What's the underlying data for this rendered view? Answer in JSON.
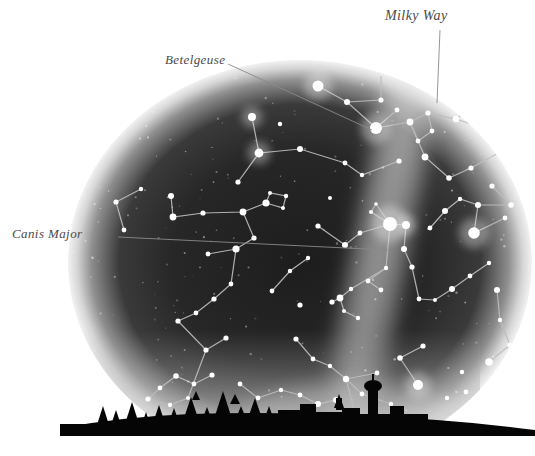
{
  "figure": {
    "background_color": "#ffffff",
    "sky_dark_color": "#262626",
    "sky_edge_glow_color": "#d8d8d8",
    "milkyway_color": "#c9c9c9",
    "star_color": "#ffffff",
    "constellation_line_color": "#bdbdbd",
    "horizon_color": "#050505",
    "label_color": "#4a4a4a",
    "leader_line_color": "#8a8a8a"
  },
  "labels": {
    "milky_way": "Milky Way",
    "betelgeuse": "Betelgeuse",
    "canis_major": "Canis Major"
  },
  "chart_data": {
    "type": "scatter",
    "xlabel": "",
    "ylabel": "",
    "grid": false,
    "legend": "none",
    "xlim": [
      0,
      535
    ],
    "ylim": [
      0,
      456
    ],
    "annotations": [
      {
        "text": "Milky Way",
        "x": 385,
        "y": 8,
        "leader_from": [
          440,
          30
        ],
        "leader_to": [
          437,
          103
        ]
      },
      {
        "text": "Betelgeuse",
        "x": 165,
        "y": 52,
        "leader_from": [
          228,
          64
        ],
        "leader_to": [
          372,
          130
        ]
      },
      {
        "text": "Canis Major",
        "x": 12,
        "y": 226,
        "leader_from": [
          118,
          237
        ],
        "leader_to": [
          388,
          250
        ]
      }
    ],
    "dome": {
      "cx": 300,
      "cy": 262,
      "rx": 232,
      "ry": 202,
      "horizon_y": 424
    },
    "milkyway_band": {
      "from": [
        400,
        58
      ],
      "to": [
        330,
        430
      ],
      "width": 70
    },
    "stars": [
      {
        "x": 318,
        "y": 86,
        "r": 5.5
      },
      {
        "x": 381,
        "y": 100,
        "r": 2.6
      },
      {
        "x": 347,
        "y": 102,
        "r": 3.0
      },
      {
        "x": 376,
        "y": 128,
        "r": 6.0
      },
      {
        "x": 397,
        "y": 110,
        "r": 2.4
      },
      {
        "x": 410,
        "y": 122,
        "r": 3.4
      },
      {
        "x": 428,
        "y": 113,
        "r": 2.6
      },
      {
        "x": 432,
        "y": 131,
        "r": 2.4
      },
      {
        "x": 418,
        "y": 141,
        "r": 2.4
      },
      {
        "x": 425,
        "y": 157,
        "r": 3.4
      },
      {
        "x": 456,
        "y": 119,
        "r": 3.2
      },
      {
        "x": 487,
        "y": 95,
        "r": 3.0
      },
      {
        "x": 519,
        "y": 140,
        "r": 5.2
      },
      {
        "x": 500,
        "y": 152,
        "r": 2.6
      },
      {
        "x": 449,
        "y": 178,
        "r": 2.8
      },
      {
        "x": 471,
        "y": 168,
        "r": 2.6
      },
      {
        "x": 492,
        "y": 186,
        "r": 2.6
      },
      {
        "x": 511,
        "y": 205,
        "r": 2.8
      },
      {
        "x": 478,
        "y": 205,
        "r": 3.0
      },
      {
        "x": 460,
        "y": 199,
        "r": 2.2
      },
      {
        "x": 445,
        "y": 211,
        "r": 3.0
      },
      {
        "x": 430,
        "y": 228,
        "r": 2.4
      },
      {
        "x": 474,
        "y": 233,
        "r": 5.8
      },
      {
        "x": 505,
        "y": 218,
        "r": 2.4
      },
      {
        "x": 252,
        "y": 117,
        "r": 4.0
      },
      {
        "x": 259,
        "y": 153,
        "r": 4.4
      },
      {
        "x": 300,
        "y": 149,
        "r": 3.0
      },
      {
        "x": 238,
        "y": 182,
        "r": 2.6
      },
      {
        "x": 171,
        "y": 196,
        "r": 3.0
      },
      {
        "x": 173,
        "y": 217,
        "r": 3.4
      },
      {
        "x": 203,
        "y": 213,
        "r": 2.6
      },
      {
        "x": 243,
        "y": 212,
        "r": 3.4
      },
      {
        "x": 266,
        "y": 203,
        "r": 3.6
      },
      {
        "x": 270,
        "y": 193,
        "r": 2.0
      },
      {
        "x": 286,
        "y": 196,
        "r": 2.2
      },
      {
        "x": 283,
        "y": 208,
        "r": 2.0
      },
      {
        "x": 254,
        "y": 238,
        "r": 2.6
      },
      {
        "x": 236,
        "y": 249,
        "r": 3.6
      },
      {
        "x": 208,
        "y": 254,
        "r": 2.4
      },
      {
        "x": 318,
        "y": 226,
        "r": 2.6
      },
      {
        "x": 345,
        "y": 245,
        "r": 3.0
      },
      {
        "x": 360,
        "y": 233,
        "r": 2.4
      },
      {
        "x": 390,
        "y": 224,
        "r": 7.0
      },
      {
        "x": 406,
        "y": 225,
        "r": 4.0
      },
      {
        "x": 371,
        "y": 212,
        "r": 2.0
      },
      {
        "x": 376,
        "y": 204,
        "r": 1.8
      },
      {
        "x": 404,
        "y": 249,
        "r": 3.0
      },
      {
        "x": 412,
        "y": 267,
        "r": 2.6
      },
      {
        "x": 386,
        "y": 268,
        "r": 2.2
      },
      {
        "x": 368,
        "y": 281,
        "r": 2.4
      },
      {
        "x": 381,
        "y": 290,
        "r": 2.4
      },
      {
        "x": 351,
        "y": 289,
        "r": 2.2
      },
      {
        "x": 340,
        "y": 298,
        "r": 3.4
      },
      {
        "x": 332,
        "y": 302,
        "r": 2.6
      },
      {
        "x": 300,
        "y": 305,
        "r": 2.6
      },
      {
        "x": 344,
        "y": 311,
        "r": 2.0
      },
      {
        "x": 358,
        "y": 318,
        "r": 2.2
      },
      {
        "x": 419,
        "y": 299,
        "r": 2.4
      },
      {
        "x": 435,
        "y": 300,
        "r": 2.0
      },
      {
        "x": 452,
        "y": 289,
        "r": 3.0
      },
      {
        "x": 470,
        "y": 276,
        "r": 2.4
      },
      {
        "x": 489,
        "y": 263,
        "r": 2.2
      },
      {
        "x": 497,
        "y": 290,
        "r": 3.0
      },
      {
        "x": 500,
        "y": 320,
        "r": 2.2
      },
      {
        "x": 510,
        "y": 345,
        "r": 2.6
      },
      {
        "x": 489,
        "y": 362,
        "r": 3.8
      },
      {
        "x": 462,
        "y": 372,
        "r": 2.2
      },
      {
        "x": 423,
        "y": 346,
        "r": 2.6
      },
      {
        "x": 400,
        "y": 358,
        "r": 2.8
      },
      {
        "x": 418,
        "y": 385,
        "r": 5.0
      },
      {
        "x": 296,
        "y": 339,
        "r": 2.6
      },
      {
        "x": 313,
        "y": 359,
        "r": 2.4
      },
      {
        "x": 330,
        "y": 366,
        "r": 2.2
      },
      {
        "x": 346,
        "y": 379,
        "r": 3.2
      },
      {
        "x": 362,
        "y": 394,
        "r": 2.4
      },
      {
        "x": 377,
        "y": 373,
        "r": 2.4
      },
      {
        "x": 391,
        "y": 404,
        "r": 2.2
      },
      {
        "x": 355,
        "y": 413,
        "r": 2.2
      },
      {
        "x": 336,
        "y": 400,
        "r": 3.0
      },
      {
        "x": 318,
        "y": 404,
        "r": 3.0
      },
      {
        "x": 300,
        "y": 395,
        "r": 2.4
      },
      {
        "x": 281,
        "y": 390,
        "r": 2.2
      },
      {
        "x": 258,
        "y": 398,
        "r": 2.4
      },
      {
        "x": 240,
        "y": 384,
        "r": 2.4
      },
      {
        "x": 212,
        "y": 375,
        "r": 2.6
      },
      {
        "x": 194,
        "y": 384,
        "r": 2.4
      },
      {
        "x": 176,
        "y": 376,
        "r": 2.8
      },
      {
        "x": 160,
        "y": 388,
        "r": 2.4
      },
      {
        "x": 148,
        "y": 399,
        "r": 2.6
      },
      {
        "x": 170,
        "y": 405,
        "r": 2.2
      },
      {
        "x": 188,
        "y": 398,
        "r": 2.0
      },
      {
        "x": 206,
        "y": 350,
        "r": 2.6
      },
      {
        "x": 226,
        "y": 338,
        "r": 2.6
      },
      {
        "x": 178,
        "y": 321,
        "r": 2.6
      },
      {
        "x": 196,
        "y": 313,
        "r": 2.4
      },
      {
        "x": 214,
        "y": 299,
        "r": 2.6
      },
      {
        "x": 231,
        "y": 284,
        "r": 2.4
      },
      {
        "x": 272,
        "y": 291,
        "r": 2.4
      },
      {
        "x": 290,
        "y": 271,
        "r": 2.2
      },
      {
        "x": 308,
        "y": 258,
        "r": 2.2
      },
      {
        "x": 447,
        "y": 398,
        "r": 2.2
      },
      {
        "x": 466,
        "y": 392,
        "r": 2.4
      },
      {
        "x": 500,
        "y": 389,
        "r": 2.8
      },
      {
        "x": 517,
        "y": 375,
        "r": 2.0
      },
      {
        "x": 124,
        "y": 230,
        "r": 2.4
      },
      {
        "x": 116,
        "y": 202,
        "r": 2.6
      },
      {
        "x": 141,
        "y": 189,
        "r": 2.2
      },
      {
        "x": 280,
        "y": 124,
        "r": 2.2
      },
      {
        "x": 345,
        "y": 163,
        "r": 2.4
      },
      {
        "x": 362,
        "y": 175,
        "r": 2.2
      },
      {
        "x": 399,
        "y": 161,
        "r": 2.6
      },
      {
        "x": 330,
        "y": 198,
        "r": 2.0
      }
    ]
  },
  "horizon": {
    "description": "dark silhouette of treeline and small town buildings with water tower",
    "tree_count": 12,
    "building_count": 7
  }
}
